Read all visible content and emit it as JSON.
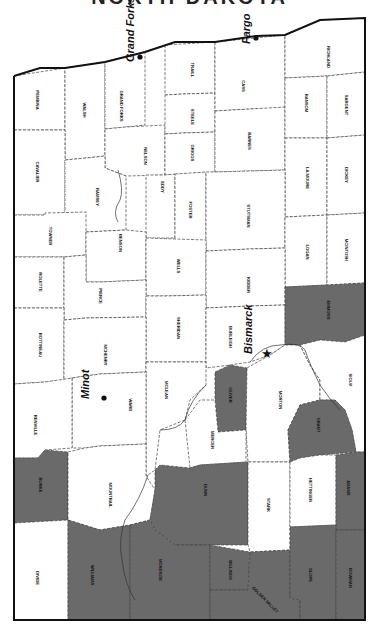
{
  "title": "NORTH DAKOTA",
  "colors": {
    "shaded": "#6a6a6a",
    "unshaded": "#ffffff",
    "border": "#111111"
  },
  "map": {
    "orientation": "rotated 90 degrees clockwise (north at left)",
    "cities": [
      {
        "name": "Grand Forks",
        "x": 140,
        "y": 58,
        "dot": [
          140,
          57
        ],
        "marker": "dot"
      },
      {
        "name": "Fargo",
        "x": 256,
        "y": 40,
        "dot": [
          256,
          38
        ],
        "marker": "dot"
      },
      {
        "name": "Bismarck",
        "x": 258,
        "y": 350,
        "dot": [
          266,
          354
        ],
        "marker": "star"
      },
      {
        "name": "Minot",
        "x": 95,
        "y": 395,
        "dot": [
          104,
          398
        ],
        "marker": "dot"
      }
    ],
    "counties": [
      {
        "name": "PEMBINA",
        "shaded": false,
        "lx": 37,
        "ly": 100,
        "pts": "14,76 65,68 65,130 14,130"
      },
      {
        "name": "WALSH",
        "shaded": false,
        "lx": 84,
        "ly": 110,
        "pts": "65,68 105,62 105,156 86,158 65,160"
      },
      {
        "name": "GRAND FORKS",
        "shaded": false,
        "lx": 121,
        "ly": 106,
        "pts": "105,62 145,52 145,125 126,127 105,129"
      },
      {
        "name": "NELSON",
        "shaded": false,
        "lx": 145,
        "ly": 156,
        "pts": "105,129 126,127 165,125 165,175 126,176 105,168"
      },
      {
        "name": "TRAILL",
        "shaded": false,
        "lx": 192,
        "ly": 70,
        "pts": "165,45 215,42 215,93 183,94 165,95"
      },
      {
        "name": "STEELE",
        "shaded": false,
        "lx": 192,
        "ly": 117,
        "pts": "165,95 183,94 215,93 215,132 183,133 165,134"
      },
      {
        "name": "GRIGGS",
        "shaded": false,
        "lx": 192,
        "ly": 153,
        "pts": "165,134 183,133 215,132 215,172 165,175"
      },
      {
        "name": "CASS",
        "shaded": false,
        "lx": 243,
        "ly": 86,
        "pts": "215,42 285,35 285,108 250,109 215,111"
      },
      {
        "name": "BARNES",
        "shaded": false,
        "lx": 249,
        "ly": 141,
        "pts": "215,111 250,109 285,107 285,170 215,172"
      },
      {
        "name": "RICHLAND",
        "shaded": false,
        "lx": 328,
        "ly": 57,
        "pts": "285,35 320,20 365,18 365,72 327,76 285,78"
      },
      {
        "name": "RANSOM",
        "shaded": false,
        "lx": 306,
        "ly": 103,
        "pts": "285,78 327,76 327,138 285,138"
      },
      {
        "name": "SARGENT",
        "shaded": false,
        "lx": 346,
        "ly": 105,
        "pts": "327,76 365,72 365,135 327,138"
      },
      {
        "name": "LA MOURE",
        "shaded": false,
        "lx": 307,
        "ly": 178,
        "pts": "285,138 327,138 327,215 285,217"
      },
      {
        "name": "DICKEY",
        "shaded": false,
        "lx": 346,
        "ly": 175,
        "pts": "327,138 365,135 365,213 327,215"
      },
      {
        "name": "CAVALIER",
        "shaded": false,
        "lx": 37,
        "ly": 172,
        "pts": "14,130 65,130 65,160 65,213 45,215 14,215"
      },
      {
        "name": "RAMSEY",
        "shaded": false,
        "lx": 97,
        "ly": 197,
        "pts": "65,160 86,158 105,156 105,168 126,176 126,230 86,232 65,232 65,213"
      },
      {
        "name": "EDDY",
        "shaded": false,
        "lx": 162,
        "ly": 187,
        "pts": "146,175 165,175 175,174 175,238 146,238"
      },
      {
        "name": "FOSTER",
        "shaded": false,
        "lx": 190,
        "ly": 210,
        "pts": "175,174 206,172 206,244 175,244"
      },
      {
        "name": "STUTSMAN",
        "shaded": false,
        "lx": 248,
        "ly": 216,
        "pts": "206,172 215,172 285,170 285,248 250,249 206,251"
      },
      {
        "name": "LOGAN",
        "shaded": false,
        "lx": 307,
        "ly": 252,
        "pts": "285,217 327,215 327,285 285,287"
      },
      {
        "name": "MCINTOSH",
        "shaded": false,
        "lx": 346,
        "ly": 250,
        "pts": "327,215 365,213 365,283 327,285"
      },
      {
        "name": "TOWNER",
        "shaded": false,
        "lx": 50,
        "ly": 236,
        "pts": "14,215 45,215 45,213 86,212 86,255 64,257 14,257"
      },
      {
        "name": "BENSON",
        "shaded": false,
        "lx": 120,
        "ly": 243,
        "pts": "86,232 126,230 146,232 146,280 100,282 86,282"
      },
      {
        "name": "WELLS",
        "shaded": false,
        "lx": 178,
        "ly": 266,
        "pts": "146,238 206,240 206,295 165,296 146,296"
      },
      {
        "name": "KIDDER",
        "shaded": false,
        "lx": 248,
        "ly": 285,
        "pts": "206,251 250,249 285,248 285,305 250,306 206,308"
      },
      {
        "name": "ROLETTE",
        "shaded": false,
        "lx": 40,
        "ly": 282,
        "pts": "14,257 64,257 64,308 14,308"
      },
      {
        "name": "PIERCE",
        "shaded": false,
        "lx": 100,
        "ly": 296,
        "pts": "64,257 86,255 86,282 100,282 146,280 146,317 86,318 64,320"
      },
      {
        "name": "SHERIDAN",
        "shaded": false,
        "lx": 178,
        "ly": 328,
        "pts": "146,296 165,296 206,295 206,362 146,362"
      },
      {
        "name": "BURLEIGH",
        "shaded": false,
        "lx": 230,
        "ly": 337,
        "pts": "206,308 250,306 285,305 285,345 270,355 250,362 230,365 206,368"
      },
      {
        "name": "EMMONS",
        "shaded": true,
        "lx": 328,
        "ly": 310,
        "pts": "285,287 327,285 365,283 365,335 345,342 320,340 300,345 285,345"
      },
      {
        "name": "BOTTINEAU",
        "shaded": false,
        "lx": 40,
        "ly": 345,
        "pts": "14,308 64,308 64,320 64,380 45,382 14,384"
      },
      {
        "name": "MCHENRY",
        "shaded": false,
        "lx": 105,
        "ly": 355,
        "pts": "64,320 86,318 146,317 146,372 100,374 72,378 64,380"
      },
      {
        "name": "MCLEAN",
        "shaded": false,
        "lx": 166,
        "ly": 390,
        "pts": "146,362 206,362 206,385 190,400 185,420 160,430 155,470 148,475 146,476"
      },
      {
        "name": "WARD",
        "shaded": false,
        "lx": 130,
        "ly": 405,
        "pts": "72,378 100,374 146,372 146,444 100,446 85,448 72,448"
      },
      {
        "name": "RENVILLE",
        "shaded": false,
        "lx": 35,
        "ly": 425,
        "pts": "14,384 45,382 72,378 72,448 45,450 38,458 14,458"
      },
      {
        "name": "OLIVER",
        "shaded": true,
        "lx": 230,
        "ly": 395,
        "pts": "215,372 230,365 247,368 246,430 218,432 215,400"
      },
      {
        "name": "MORTON",
        "shaded": false,
        "lx": 280,
        "ly": 400,
        "pts": "247,368 270,355 285,345 300,345 310,365 320,380 320,400 300,405 288,430 290,462 248,462 246,430"
      },
      {
        "name": "SIOUX",
        "shaded": false,
        "lx": 350,
        "ly": 380,
        "pts": "300,345 320,340 345,342 365,335 365,452 356,452 352,430 345,410 335,400 320,400 320,380 310,365"
      },
      {
        "name": "MERCER",
        "shaded": false,
        "lx": 212,
        "ly": 440,
        "pts": "185,420 200,400 215,400 218,432 246,430 246,462 200,465 190,468"
      },
      {
        "name": "GRANT",
        "shaded": true,
        "lx": 318,
        "ly": 425,
        "pts": "320,400 335,400 345,410 352,430 356,452 320,455 300,458 290,462 288,430 300,405"
      },
      {
        "name": "BURKE",
        "shaded": true,
        "lx": 40,
        "ly": 485,
        "pts": "14,458 38,458 45,450 68,452 68,520 14,523"
      },
      {
        "name": "MOUNTRAIL",
        "shaded": false,
        "lx": 110,
        "ly": 495,
        "pts": "68,452 85,448 100,446 146,444 146,476 155,490 150,520 130,525 100,530 68,520"
      },
      {
        "name": "DUNN",
        "shaded": true,
        "lx": 205,
        "ly": 490,
        "pts": "155,470 160,465 190,468 200,465 248,462 248,545 200,545 175,545 155,530 150,520 155,490"
      },
      {
        "name": "STARK",
        "shaded": false,
        "lx": 268,
        "ly": 505,
        "pts": "248,462 290,462 290,550 250,552 248,545"
      },
      {
        "name": "HETTINGER",
        "shaded": false,
        "lx": 310,
        "ly": 490,
        "pts": "290,462 300,458 320,455 336,455 336,525 290,527"
      },
      {
        "name": "ADAMS",
        "shaded": true,
        "lx": 348,
        "ly": 488,
        "pts": "336,455 356,452 365,452 365,530 336,530"
      },
      {
        "name": "DIVIDE",
        "shaded": false,
        "lx": 37,
        "ly": 578,
        "pts": "14,523 68,520 68,620 14,620"
      },
      {
        "name": "WILLIAMS",
        "shaded": true,
        "lx": 92,
        "ly": 575,
        "pts": "68,520 100,530 130,525 130,620 68,620"
      },
      {
        "name": "MCKENZIE",
        "shaded": true,
        "lx": 160,
        "ly": 570,
        "pts": "130,525 150,520 155,530 175,545 210,545 210,620 130,620"
      },
      {
        "name": "BILLINGS",
        "shaded": true,
        "lx": 230,
        "ly": 570,
        "pts": "210,545 250,552 248,590 210,590"
      },
      {
        "name": "GOLDEN VALLEY",
        "shaded": true,
        "lx": 265,
        "ly": 600,
        "pts": "210,590 248,590 250,552 290,550 290,598 300,600 300,620 210,620"
      },
      {
        "name": "SLOPE",
        "shaded": true,
        "lx": 310,
        "ly": 575,
        "pts": "290,527 336,525 336,620 300,620 300,600 290,598"
      },
      {
        "name": "BOWMAN",
        "shaded": true,
        "lx": 350,
        "ly": 578,
        "pts": "336,530 365,530 365,620 336,620"
      }
    ],
    "outline": "14,76 40,68 65,68 105,62 145,52 175,42 215,42 256,36 285,35 320,20 365,18 365,620 14,620 14,76"
  }
}
